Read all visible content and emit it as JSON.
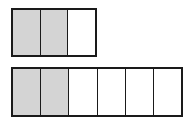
{
  "diagram": {
    "type": "fraction-bars",
    "colors": {
      "shaded": "#d4d4d4",
      "unshaded": "#ffffff",
      "stroke": "#1a1a1a"
    },
    "bars": [
      {
        "name": "top-bar",
        "parts": 3,
        "shaded": 2,
        "fraction": "2/3",
        "x": 11,
        "y": 8,
        "width": 86,
        "height": 49
      },
      {
        "name": "bottom-bar",
        "parts": 6,
        "shaded": 2,
        "fraction": "2/6",
        "x": 11,
        "y": 67,
        "width": 172,
        "height": 50
      }
    ]
  }
}
